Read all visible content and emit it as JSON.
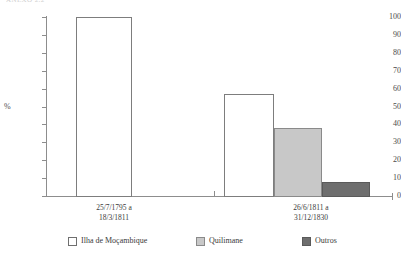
{
  "caption_sliver": "ANEXO 2.2",
  "chart_data": {
    "type": "bar",
    "title": "",
    "subtitle": "",
    "xlabel": "",
    "ylabel": "%",
    "ylim": [
      0,
      100
    ],
    "yticks": [
      0,
      10,
      20,
      30,
      40,
      50,
      60,
      70,
      80,
      90,
      100
    ],
    "ytick_labels": [
      "0",
      "10",
      "20",
      "30",
      "40",
      "50",
      "60",
      "70",
      "80",
      "90",
      "100"
    ],
    "grid": false,
    "legend_position": "bottom",
    "categories": [
      "25/7/1795 a\n18/3/1811",
      "26/6/1811 a\n31/12/1830"
    ],
    "category_lines": [
      [
        "25/7/1795 a",
        "18/3/1811"
      ],
      [
        "26/6/1811 a",
        "31/12/1830"
      ]
    ],
    "series": [
      {
        "name": "Ilha de Moçambique",
        "color": "#ffffff",
        "values": [
          100,
          57
        ]
      },
      {
        "name": "Quilimane",
        "color": "#c8c8c8",
        "values": [
          0,
          38
        ]
      },
      {
        "name": "Outros",
        "color": "#6e6e6e",
        "values": [
          0,
          8
        ]
      }
    ]
  },
  "legend": {
    "items": [
      {
        "label": "Ilha de Moçambique",
        "swatch": "white"
      },
      {
        "label": "Quilimane",
        "swatch": "light"
      },
      {
        "label": "Outros",
        "swatch": "dark"
      }
    ]
  },
  "colors": {
    "axis": "#8d8d8d",
    "text": "#3a3a3a",
    "series_white": "#ffffff",
    "series_light": "#c8c8c8",
    "series_dark": "#6e6e6e"
  }
}
